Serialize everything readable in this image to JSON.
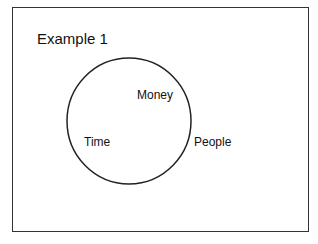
{
  "diagram": {
    "title": "Example 1",
    "shape": "circle",
    "labels": {
      "money": "Money",
      "time": "Time",
      "people": "People"
    },
    "colors": {
      "stroke": "#222222",
      "background": "#ffffff"
    }
  }
}
